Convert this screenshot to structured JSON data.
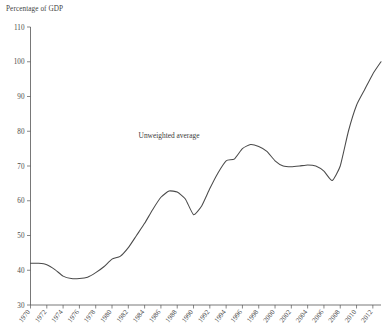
{
  "chart_data": {
    "type": "line",
    "title": "",
    "xlabel": "",
    "ylabel": "Percentage of GDP",
    "ylim": [
      30,
      110
    ],
    "xlim": [
      1970,
      2013
    ],
    "grid": false,
    "legend_position": "inline-annotation",
    "annotations": [
      {
        "text": "Unweighted average",
        "x": 1987,
        "y": 78
      }
    ],
    "ytick_labels": [
      "30",
      "40",
      "50",
      "60",
      "70",
      "80",
      "90",
      "100",
      "110"
    ],
    "ytick_values": [
      30,
      40,
      50,
      60,
      70,
      80,
      90,
      100,
      110
    ],
    "xtick_labels": [
      "1970",
      "1972",
      "1974",
      "1976",
      "1978",
      "1980",
      "1982",
      "1984",
      "1986",
      "1988",
      "1990",
      "1992",
      "1994",
      "1996",
      "1998",
      "2000",
      "2002",
      "2004",
      "2006",
      "2008",
      "2010",
      "2012"
    ],
    "xtick_values": [
      1970,
      1972,
      1974,
      1976,
      1978,
      1980,
      1982,
      1984,
      1986,
      1988,
      1990,
      1992,
      1994,
      1996,
      1998,
      2000,
      2002,
      2004,
      2006,
      2008,
      2010,
      2012
    ],
    "series": [
      {
        "name": "Unweighted average",
        "color": "#4a4a4a",
        "x": [
          1970,
          1971,
          1972,
          1973,
          1974,
          1975,
          1976,
          1977,
          1978,
          1979,
          1980,
          1981,
          1982,
          1983,
          1984,
          1985,
          1986,
          1987,
          1988,
          1989,
          1990,
          1991,
          1992,
          1993,
          1994,
          1995,
          1996,
          1997,
          1998,
          1999,
          2000,
          2001,
          2002,
          2003,
          2004,
          2005,
          2006,
          2007,
          2008,
          2009,
          2010,
          2011,
          2012,
          2013
        ],
        "values": [
          42.0,
          42.0,
          41.6,
          40.2,
          38.3,
          37.6,
          37.6,
          38.0,
          39.3,
          41.0,
          43.2,
          44.0,
          46.5,
          50.0,
          53.5,
          57.5,
          61.0,
          62.8,
          62.5,
          60.5,
          56.0,
          58.5,
          63.5,
          68.0,
          71.5,
          72.0,
          75.0,
          76.2,
          75.6,
          74.2,
          71.5,
          70.0,
          69.8,
          70.0,
          70.3,
          70.0,
          68.5,
          65.8,
          70.0,
          80.0,
          87.5,
          92.0,
          96.5,
          100.0
        ]
      }
    ]
  },
  "axis": {
    "ylabel_text": "Percentage of GDP"
  }
}
